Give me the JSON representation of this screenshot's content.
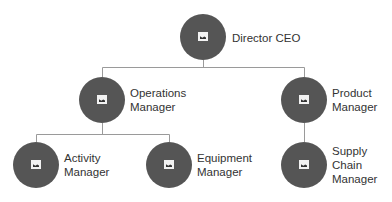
{
  "diagram": {
    "type": "org-chart",
    "colors": {
      "node": "#555555",
      "line": "#9a9a9a",
      "text": "#333333",
      "background": "#ffffff"
    },
    "nodes": [
      {
        "id": "ceo",
        "label": "Director CEO",
        "icon": "image-placeholder-icon"
      },
      {
        "id": "ops",
        "label": "Operations\nManager",
        "icon": "image-placeholder-icon",
        "parent": "ceo"
      },
      {
        "id": "product",
        "label": "Product\nManager",
        "icon": "image-placeholder-icon",
        "parent": "ceo"
      },
      {
        "id": "activity",
        "label": "Activity\nManager",
        "icon": "image-placeholder-icon",
        "parent": "ops"
      },
      {
        "id": "equipment",
        "label": "Equipment\nManager",
        "icon": "image-placeholder-icon",
        "parent": "ops"
      },
      {
        "id": "supply",
        "label": "Supply\nChain\nManager",
        "icon": "image-placeholder-icon",
        "parent": "product"
      }
    ]
  }
}
